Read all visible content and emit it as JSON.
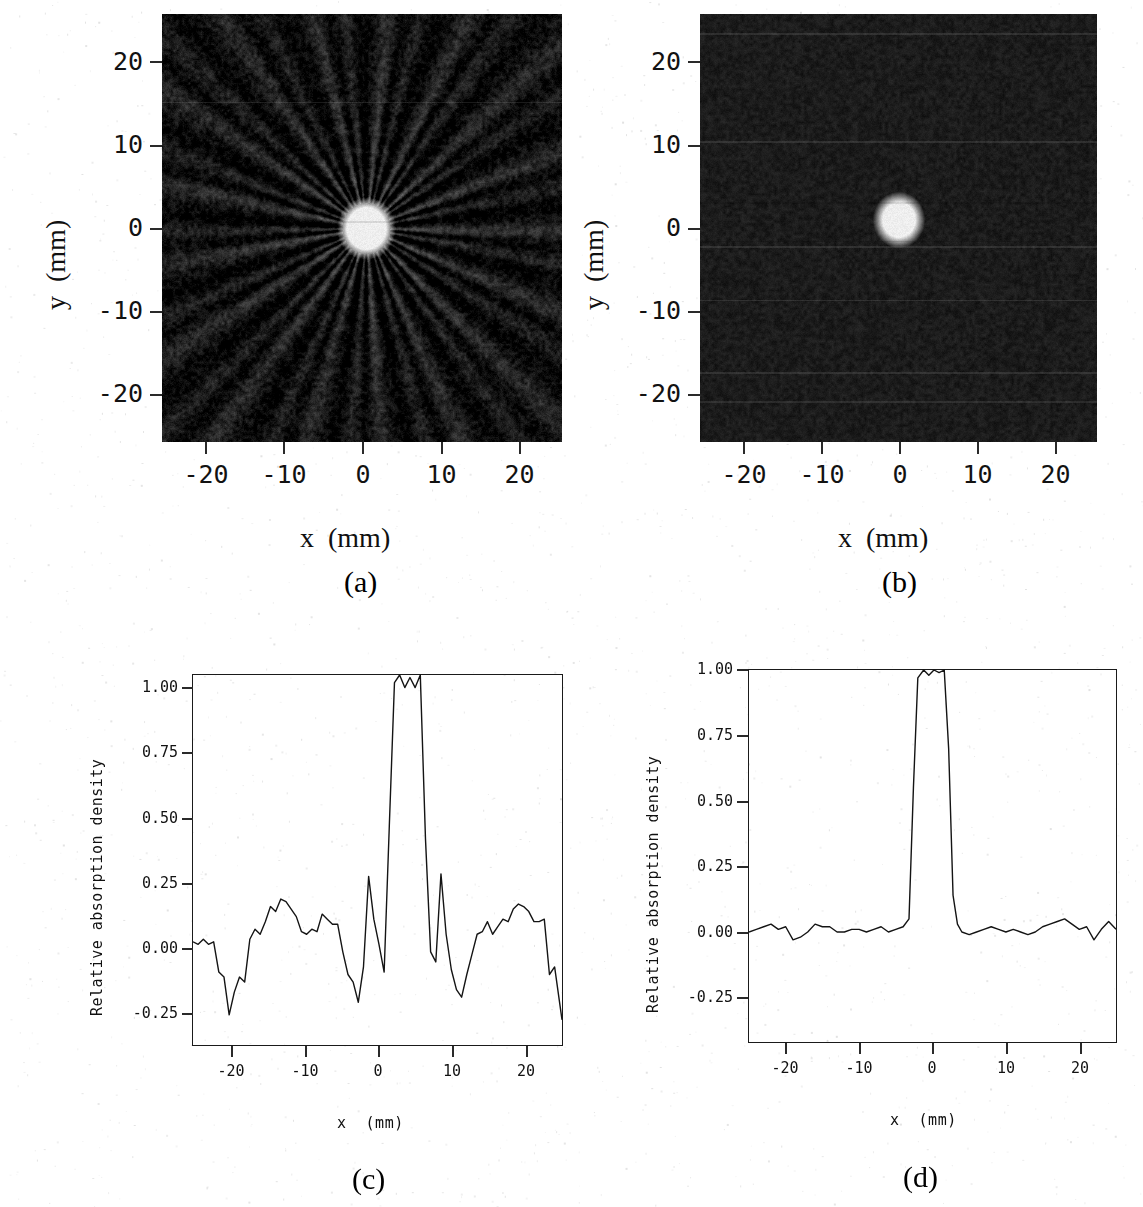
{
  "figure": {
    "background_color": "#ffffff",
    "ink_color": "#111111"
  },
  "panels": [
    {
      "id": "a",
      "caption": "(a)",
      "type": "image",
      "xlabel": "x  (mm)",
      "ylabel": "y  (mm)",
      "xticks": [
        "-20",
        "-10",
        "0",
        "10",
        "20"
      ],
      "xtick_values": [
        -20,
        -10,
        0,
        10,
        20
      ],
      "yticks": [
        "20",
        "10",
        "0",
        "-10",
        "-20"
      ],
      "ytick_values": [
        20,
        10,
        0,
        -10,
        -20
      ],
      "xlim": [
        -25,
        25
      ],
      "ylim": [
        -25,
        25
      ],
      "description": "Grayscale reconstruction with strong radial streak artifacts and a bright circular object at the centre",
      "background_gray": "#141414",
      "spot_color": "#f2f0e8",
      "spot_center_mm": [
        0.5,
        0.0
      ],
      "spot_radius_mm": 3.0,
      "streaks": true,
      "noise_amplitude": 0.42
    },
    {
      "id": "b",
      "caption": "(b)",
      "type": "image",
      "xlabel": "x  (mm)",
      "ylabel": "y  (mm)",
      "xticks": [
        "-20",
        "-10",
        "0",
        "10",
        "20"
      ],
      "xtick_values": [
        -20,
        -10,
        0,
        10,
        20
      ],
      "yticks": [
        "20",
        "10",
        "0",
        "-10",
        "-20"
      ],
      "ytick_values": [
        20,
        10,
        0,
        -10,
        -20
      ],
      "xlim": [
        -25,
        25
      ],
      "ylim": [
        -25,
        25
      ],
      "description": "Grayscale reconstruction without streak artifacts; uniform fine background noise and a bright circular object at the centre",
      "background_gray": "#1b1b1b",
      "spot_color": "#f4f2ea",
      "spot_center_mm": [
        0.0,
        1.0
      ],
      "spot_radius_mm": 2.6,
      "streaks": false,
      "noise_amplitude": 0.2
    },
    {
      "id": "c",
      "caption": "(c)",
      "type": "line",
      "xlabel": "x  (mm)",
      "ylabel": "Relative absorption density",
      "xticks": [
        "-20",
        "-10",
        "0",
        "10",
        "20"
      ],
      "xtick_values": [
        -20,
        -10,
        0,
        10,
        20
      ],
      "yticks": [
        "1.00",
        "0.75",
        "0.50",
        "0.25",
        "0.00",
        "-0.25"
      ],
      "ytick_values": [
        1.0,
        0.75,
        0.5,
        0.25,
        0.0,
        -0.25
      ]
    },
    {
      "id": "d",
      "caption": "(d)",
      "type": "line",
      "xlabel": "x  (mm)",
      "ylabel": "Relative absorption density",
      "xticks": [
        "-20",
        "-10",
        "0",
        "10",
        "20"
      ],
      "xtick_values": [
        -20,
        -10,
        0,
        10,
        20
      ],
      "yticks": [
        "1.00",
        "0.75",
        "0.50",
        "0.25",
        "0.00",
        "-0.25"
      ],
      "ytick_values": [
        1.0,
        0.75,
        0.5,
        0.25,
        0.0,
        -0.25
      ]
    }
  ],
  "chart_data": [
    {
      "panel": "c",
      "type": "line",
      "title": "",
      "xlabel": "x  (mm)",
      "ylabel": "Relative absorption density",
      "xlim": [
        -25,
        25
      ],
      "ylim": [
        -0.42,
        1.05
      ],
      "grid": false,
      "legend": "none",
      "xticks": [
        -20,
        -10,
        0,
        10,
        20
      ],
      "yticks": [
        1.0,
        0.75,
        0.5,
        0.25,
        0.0,
        -0.25
      ],
      "annotation": "Profile with streak-artifact noise: strong low-frequency ripples of +/-0.25 around the baseline and side lobes of +0.25 adjacent to the central plateau",
      "x": [
        -25.0,
        -24.3,
        -23.6,
        -22.9,
        -22.2,
        -21.5,
        -20.8,
        -20.1,
        -19.4,
        -18.7,
        -18.0,
        -17.3,
        -16.6,
        -15.9,
        -15.2,
        -14.5,
        -13.8,
        -13.1,
        -12.4,
        -11.7,
        -11.0,
        -10.3,
        -9.6,
        -8.9,
        -8.2,
        -7.5,
        -6.8,
        -6.1,
        -5.4,
        -4.7,
        -4.0,
        -3.3,
        -2.6,
        -1.9,
        -1.2,
        -0.5,
        0.2,
        0.9,
        1.6,
        2.3,
        3.0,
        3.7,
        4.4,
        5.1,
        5.8,
        6.5,
        7.2,
        7.9,
        8.6,
        9.3,
        10.0,
        10.7,
        11.4,
        12.1,
        12.8,
        13.5,
        14.2,
        14.9,
        15.6,
        16.3,
        17.0,
        17.7,
        18.4,
        19.1,
        19.8,
        20.5,
        21.2,
        21.9,
        22.6,
        23.3,
        24.0,
        25.0
      ],
      "y": [
        -0.01,
        -0.02,
        0.0,
        -0.02,
        -0.01,
        -0.13,
        -0.15,
        -0.3,
        -0.21,
        -0.15,
        -0.17,
        0.0,
        0.04,
        0.02,
        0.07,
        0.13,
        0.11,
        0.16,
        0.15,
        0.12,
        0.09,
        0.03,
        0.02,
        0.04,
        0.03,
        0.1,
        0.08,
        0.06,
        0.06,
        -0.05,
        -0.14,
        -0.17,
        -0.25,
        -0.11,
        0.25,
        0.08,
        -0.02,
        -0.13,
        0.45,
        1.02,
        1.05,
        1.0,
        1.04,
        1.0,
        1.05,
        0.4,
        -0.05,
        -0.09,
        0.26,
        0.02,
        -0.12,
        -0.2,
        -0.23,
        -0.14,
        -0.06,
        0.02,
        0.03,
        0.07,
        0.02,
        0.05,
        0.08,
        0.07,
        0.12,
        0.14,
        0.13,
        0.11,
        0.07,
        0.07,
        0.08,
        -0.14,
        -0.11,
        -0.32,
        -0.17,
        -0.16,
        -0.02,
        0.04,
        0.01,
        -0.04
      ]
    },
    {
      "panel": "d",
      "type": "line",
      "title": "",
      "xlabel": "x  (mm)",
      "ylabel": "Relative absorption density",
      "xlim": [
        -25,
        25
      ],
      "ylim": [
        -0.42,
        1.0
      ],
      "grid": false,
      "legend": "none",
      "xticks": [
        -20,
        -10,
        0,
        10,
        20
      ],
      "yticks": [
        1.0,
        0.75,
        0.5,
        0.25,
        0.0,
        -0.25
      ],
      "annotation": "Artifact-free profile: flat baseline near 0.00 with +/-0.03 noise and a sharp rectangular central peak reaching 1.00",
      "x": [
        -25.0,
        -24.0,
        -23.0,
        -22.0,
        -21.0,
        -20.0,
        -19.0,
        -18.0,
        -17.0,
        -16.0,
        -15.0,
        -14.0,
        -13.0,
        -12.0,
        -11.0,
        -10.0,
        -9.0,
        -8.0,
        -7.0,
        -6.0,
        -5.0,
        -4.0,
        -3.2,
        -2.6,
        -2.0,
        -1.2,
        -0.5,
        0.2,
        0.9,
        1.6,
        2.2,
        2.8,
        3.4,
        4.0,
        5.0,
        6.0,
        7.0,
        8.0,
        9.0,
        10.0,
        11.0,
        12.0,
        13.0,
        14.0,
        15.0,
        16.0,
        17.0,
        18.0,
        19.0,
        20.0,
        21.0,
        22.0,
        23.0,
        24.0,
        25.0
      ],
      "y": [
        0.0,
        0.01,
        0.02,
        0.03,
        0.01,
        0.02,
        -0.03,
        -0.02,
        0.0,
        0.03,
        0.02,
        0.02,
        0.0,
        0.0,
        0.01,
        0.01,
        0.0,
        0.01,
        0.02,
        0.0,
        0.01,
        0.02,
        0.05,
        0.55,
        0.97,
        1.0,
        0.98,
        1.0,
        0.99,
        1.0,
        0.7,
        0.14,
        0.03,
        0.0,
        -0.01,
        0.0,
        0.01,
        0.02,
        0.01,
        0.0,
        0.01,
        0.0,
        -0.01,
        0.0,
        0.02,
        0.03,
        0.04,
        0.05,
        0.03,
        0.01,
        0.02,
        -0.03,
        0.01,
        0.04,
        0.01
      ]
    }
  ]
}
